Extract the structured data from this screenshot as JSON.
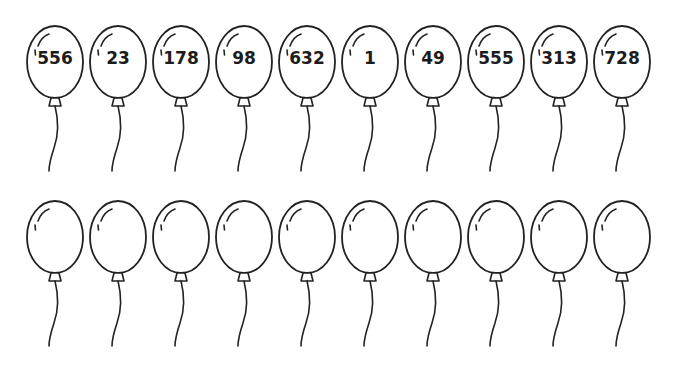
{
  "worksheet": {
    "stroke_color": "#222222",
    "background_color": "#ffffff",
    "top_row": {
      "balloons": [
        {
          "label": "556"
        },
        {
          "label": "23"
        },
        {
          "label": "178"
        },
        {
          "label": "98"
        },
        {
          "label": "632"
        },
        {
          "label": "1"
        },
        {
          "label": "49"
        },
        {
          "label": "555"
        },
        {
          "label": "313"
        },
        {
          "label": "728"
        }
      ]
    },
    "bottom_row": {
      "balloons": [
        {
          "label": ""
        },
        {
          "label": ""
        },
        {
          "label": ""
        },
        {
          "label": ""
        },
        {
          "label": ""
        },
        {
          "label": ""
        },
        {
          "label": ""
        },
        {
          "label": ""
        },
        {
          "label": ""
        },
        {
          "label": ""
        }
      ]
    }
  }
}
